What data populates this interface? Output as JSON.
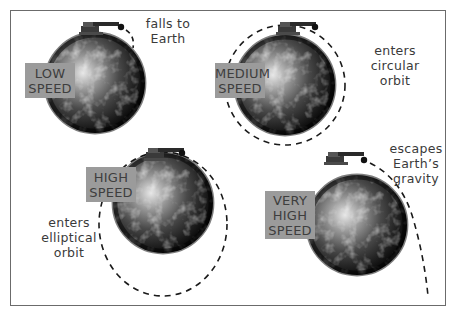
{
  "scenarios": [
    {
      "id": "low",
      "speed_label": [
        "LOW",
        "SPEED"
      ],
      "outcome": [
        "falls to",
        "Earth"
      ]
    },
    {
      "id": "medium",
      "speed_label": [
        "MEDIUM",
        "SPEED"
      ],
      "outcome": [
        "enters",
        "circular",
        "orbit"
      ]
    },
    {
      "id": "high",
      "speed_label": [
        "HIGH",
        "SPEED"
      ],
      "outcome": [
        "enters",
        "elliptical",
        "orbit"
      ]
    },
    {
      "id": "very-high",
      "speed_label": [
        "VERY",
        "HIGH",
        "SPEED"
      ],
      "outcome": [
        "escapes",
        "Earth’s",
        "gravity"
      ]
    }
  ],
  "colors": {
    "label_box": "#9b9b9b",
    "label_text": "#3e3e3e",
    "caption_text": "#3a3a3a",
    "trajectory": "#1a1a1a",
    "frame": "#6b6b6b"
  }
}
